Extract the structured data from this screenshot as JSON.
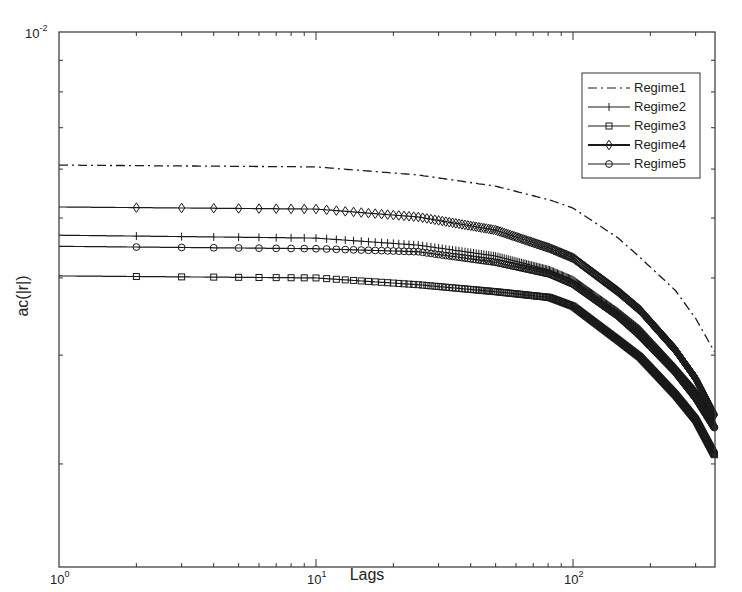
{
  "chart_data": {
    "type": "line",
    "title": "",
    "xlabel": "Lags",
    "ylabel": "ac(|r|)",
    "xscale": "log",
    "yscale": "log",
    "xlim": [
      1,
      355
    ],
    "ylim": [
      0.00136,
      0.01
    ],
    "grid": false,
    "legend_position": "upper right (inside)",
    "x_tick_labels": [
      "10^0",
      "10^1",
      "10^2"
    ],
    "y_tick_labels": [
      "10^-2"
    ],
    "x": [
      1,
      10,
      25,
      50,
      81,
      100,
      150,
      182,
      250,
      300,
      355
    ],
    "series": [
      {
        "name": "Regime1",
        "style": "dash-dot",
        "marker": "none",
        "values": [
          0.00609,
          0.00605,
          0.00587,
          0.00563,
          0.00535,
          0.00519,
          0.00464,
          0.00432,
          0.00382,
          0.00344,
          0.00304
        ]
      },
      {
        "name": "Regime2",
        "style": "solid",
        "marker": "plus",
        "values": [
          0.00469,
          0.00464,
          0.00452,
          0.00434,
          0.00412,
          0.00397,
          0.00352,
          0.0033,
          0.00286,
          0.00262,
          0.00237
        ]
      },
      {
        "name": "Regime3",
        "style": "solid",
        "marker": "square",
        "values": [
          0.00403,
          0.004,
          0.0039,
          0.0038,
          0.00372,
          0.0036,
          0.00317,
          0.00298,
          0.00259,
          0.00236,
          0.00207
        ]
      },
      {
        "name": "Regime4",
        "style": "solid",
        "marker": "diamond",
        "values": [
          0.00521,
          0.00517,
          0.00502,
          0.00478,
          0.00447,
          0.00431,
          0.0038,
          0.00355,
          0.00306,
          0.00275,
          0.0024
        ]
      },
      {
        "name": "Regime5",
        "style": "solid",
        "marker": "circle",
        "values": [
          0.0045,
          0.00446,
          0.00441,
          0.00424,
          0.00406,
          0.00391,
          0.00347,
          0.00323,
          0.00282,
          0.00256,
          0.00229
        ]
      }
    ]
  },
  "axes": {
    "xlabel": "Lags",
    "ylabel": "ac(|r|)",
    "x_ticks": [
      {
        "base": "10",
        "exp": "0"
      },
      {
        "base": "10",
        "exp": "1"
      },
      {
        "base": "10",
        "exp": "2"
      }
    ],
    "y_top": {
      "base": "10",
      "exp": "-2"
    }
  },
  "legend": {
    "items": [
      {
        "label": "Regime1"
      },
      {
        "label": "Regime2"
      },
      {
        "label": "Regime3"
      },
      {
        "label": "Regime4"
      },
      {
        "label": "Regime5"
      }
    ]
  },
  "colors": {
    "line": "#1a1a1a",
    "axis": "#333333",
    "background": "#ffffff"
  }
}
